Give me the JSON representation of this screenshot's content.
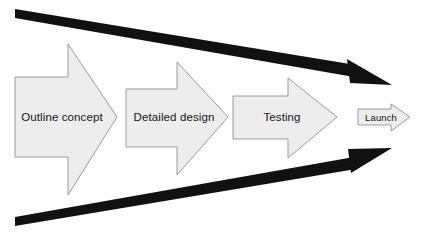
{
  "diagram": {
    "type": "funnel-process-flow",
    "background_color": "#ffffff",
    "stages": [
      {
        "id": "outline-concept",
        "label": "Outline concept",
        "order": 1,
        "fill_color": "#ededed",
        "stroke_color": "#9a9a9a",
        "text_color": "#141414"
      },
      {
        "id": "detailed-design",
        "label": "Detailed design",
        "order": 2,
        "fill_color": "#ededed",
        "stroke_color": "#9a9a9a",
        "text_color": "#141414"
      },
      {
        "id": "testing",
        "label": "Testing",
        "order": 3,
        "fill_color": "#ededed",
        "stroke_color": "#9a9a9a",
        "text_color": "#141414"
      },
      {
        "id": "launch",
        "label": "Launch",
        "order": 4,
        "fill_color": "#ededed",
        "stroke_color": "#9a9a9a",
        "text_color": "#141414"
      }
    ],
    "funnel_lines": [
      {
        "id": "top-converging-arrow",
        "color": "#111111",
        "from": {
          "x": 15,
          "y": 13
        },
        "to": {
          "x": 392,
          "y": 85
        },
        "has_arrowhead": true
      },
      {
        "id": "bottom-converging-arrow",
        "color": "#111111",
        "from": {
          "x": 15,
          "y": 222
        },
        "to": {
          "x": 392,
          "y": 148
        },
        "has_arrowhead": true
      }
    ]
  }
}
